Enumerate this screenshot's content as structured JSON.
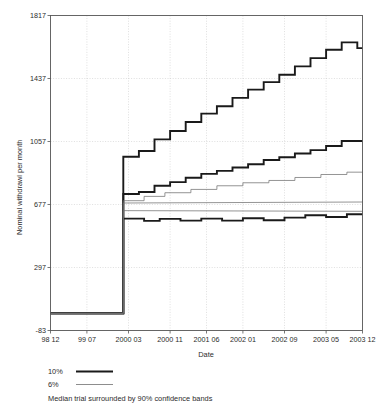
{
  "chart_data": {
    "type": "line",
    "title": "",
    "xlabel": "Date",
    "ylabel": "Nominal withdrawl per month",
    "ylim": [
      -83,
      1817
    ],
    "xlim": [
      0,
      60
    ],
    "grid": true,
    "legend_position": "below-axes",
    "yticks": [
      -83,
      297,
      677,
      1057,
      1437,
      1817
    ],
    "ytick_labels": [
      "-83",
      "297",
      "677",
      "1057",
      "1437",
      "1817"
    ],
    "xticks": [
      0,
      7,
      15,
      23,
      30,
      37,
      45,
      53,
      60
    ],
    "xtick_labels": [
      "98 12",
      "99 07",
      "2000 03",
      "2000 11",
      "2001 06",
      "2002 01",
      "2002 09",
      "2003 05",
      "2003 12"
    ],
    "annotation": "Median trial surrounded by 90% confidence bands",
    "series": [
      {
        "name": "10% upper confidence band",
        "legend_key": "10%",
        "style": "thick",
        "color": "#1a1a1a",
        "width": 1.9,
        "x": [
          0,
          14,
          14,
          17,
          17,
          20,
          20,
          23,
          23,
          26,
          26,
          29,
          29,
          32,
          32,
          35,
          35,
          38,
          38,
          41,
          41,
          44,
          44,
          47,
          47,
          50,
          50,
          53,
          53,
          56,
          56,
          59,
          59,
          60
        ],
        "y": [
          20,
          20,
          965,
          965,
          1000,
          1000,
          1070,
          1070,
          1120,
          1120,
          1175,
          1175,
          1225,
          1225,
          1270,
          1270,
          1320,
          1320,
          1370,
          1370,
          1415,
          1415,
          1460,
          1460,
          1510,
          1510,
          1560,
          1560,
          1610,
          1610,
          1655,
          1655,
          1620,
          1620
        ]
      },
      {
        "name": "10% median trial",
        "legend_key": "10%",
        "style": "thick",
        "color": "#1a1a1a",
        "width": 1.9,
        "x": [
          0,
          14,
          14,
          17,
          17,
          20,
          20,
          23,
          23,
          26,
          26,
          29,
          29,
          32,
          32,
          35,
          35,
          38,
          38,
          41,
          41,
          44,
          44,
          47,
          47,
          50,
          50,
          53,
          53,
          56,
          56,
          60
        ],
        "y": [
          20,
          20,
          740,
          740,
          752,
          752,
          790,
          790,
          812,
          812,
          838,
          838,
          862,
          862,
          880,
          880,
          900,
          900,
          920,
          920,
          945,
          945,
          962,
          962,
          985,
          985,
          1005,
          1005,
          1030,
          1030,
          1060,
          1060
        ]
      },
      {
        "name": "10% lower confidence band",
        "legend_key": "10%",
        "style": "thick",
        "color": "#1a1a1a",
        "width": 1.9,
        "x": [
          0,
          14,
          14,
          18,
          18,
          21,
          21,
          25,
          25,
          29,
          29,
          33,
          33,
          37,
          37,
          41,
          41,
          45,
          45,
          49,
          49,
          53,
          53,
          57,
          57,
          60
        ],
        "y": [
          20,
          20,
          592,
          592,
          578,
          578,
          590,
          590,
          580,
          580,
          592,
          592,
          580,
          580,
          594,
          594,
          582,
          582,
          598,
          598,
          612,
          612,
          602,
          602,
          618,
          618
        ]
      },
      {
        "name": "6% upper confidence band",
        "legend_key": "6%",
        "style": "thin",
        "color": "#707070",
        "width": 0.75,
        "x": [
          0,
          14,
          14,
          18,
          18,
          22,
          22,
          27,
          27,
          32,
          32,
          37,
          37,
          42,
          42,
          47,
          47,
          52,
          52,
          57,
          57,
          60
        ],
        "y": [
          20,
          20,
          700,
          700,
          726,
          726,
          748,
          748,
          768,
          768,
          790,
          790,
          808,
          808,
          822,
          822,
          840,
          840,
          858,
          858,
          872,
          872
        ]
      },
      {
        "name": "6% median trial",
        "legend_key": "6%",
        "style": "thin",
        "color": "#707070",
        "width": 0.75,
        "x": [
          0,
          14,
          14,
          60
        ],
        "y": [
          20,
          20,
          686,
          692
        ]
      },
      {
        "name": "6% lower confidence band",
        "legend_key": "6%",
        "style": "thin",
        "color": "#707070",
        "width": 0.75,
        "x": [
          0,
          14,
          14,
          60
        ],
        "y": [
          20,
          20,
          640,
          636
        ]
      }
    ]
  },
  "legend": {
    "entries": [
      {
        "label": "10%",
        "style": "thick"
      },
      {
        "label": "6%",
        "style": "thin"
      }
    ],
    "caption": "Median trial surrounded by 90% confidence bands"
  }
}
